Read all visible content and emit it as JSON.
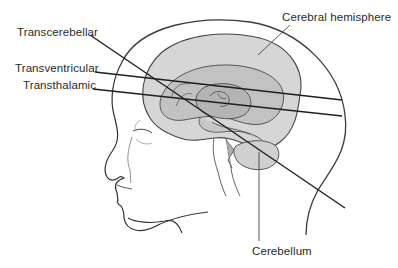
{
  "diagram": {
    "type": "anatomical-illustration",
    "labels": {
      "transcerebellar": "Transcerebellar",
      "transventricular": "Transventricular",
      "transthalamic": "Transthalamic",
      "cerebral_hemisphere": "Cerebral hemisphere",
      "cerebellum": "Cerebellum"
    },
    "planes": [
      {
        "name": "Transcerebellar",
        "from": [
          90,
          35
        ],
        "to": [
          345,
          208
        ]
      },
      {
        "name": "Transventricular",
        "from": [
          95,
          72
        ],
        "to": [
          342,
          100
        ]
      },
      {
        "name": "Transthalamic",
        "from": [
          93,
          89
        ],
        "to": [
          342,
          116
        ]
      }
    ],
    "colors": {
      "line": "#1e1e1e",
      "outline": "#3a3a3a",
      "brain_fill": "#d6d6d6",
      "inner_fill": "#bdbdbd",
      "deep_fill": "#a9a9a9",
      "text": "#2a2a2a"
    }
  }
}
